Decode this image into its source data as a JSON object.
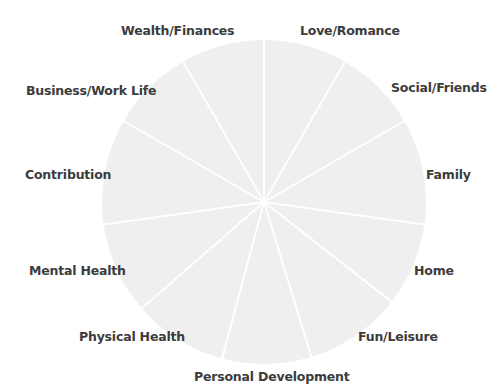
{
  "diagram": {
    "type": "wheel-of-life",
    "center": {
      "x": 264,
      "y": 202
    },
    "radius": 162,
    "colors": {
      "fill": "#efefef",
      "spoke": "#ffffff",
      "label_text": "#3c3c3c",
      "background": "#ffffff"
    },
    "spoke_angles_deg": [
      0,
      30,
      60,
      98,
      128,
      163,
      195,
      229,
      262,
      300,
      330
    ],
    "segments": [
      {
        "label": "Love/Romance",
        "x": 300,
        "y": 24
      },
      {
        "label": "Social/Friends",
        "x": 391,
        "y": 81
      },
      {
        "label": "Family",
        "x": 426,
        "y": 168
      },
      {
        "label": "Home",
        "x": 414,
        "y": 264
      },
      {
        "label": "Fun/Leisure",
        "x": 358,
        "y": 330
      },
      {
        "label": "Personal Development",
        "x": 194,
        "y": 370
      },
      {
        "label": "Physical Health",
        "x": 79,
        "y": 330
      },
      {
        "label": "Mental Health",
        "x": 29,
        "y": 264
      },
      {
        "label": "Contribution",
        "x": 25,
        "y": 168
      },
      {
        "label": "Business/Work Life",
        "x": 26,
        "y": 84
      },
      {
        "label": "Wealth/Finances",
        "x": 121,
        "y": 24
      }
    ]
  }
}
